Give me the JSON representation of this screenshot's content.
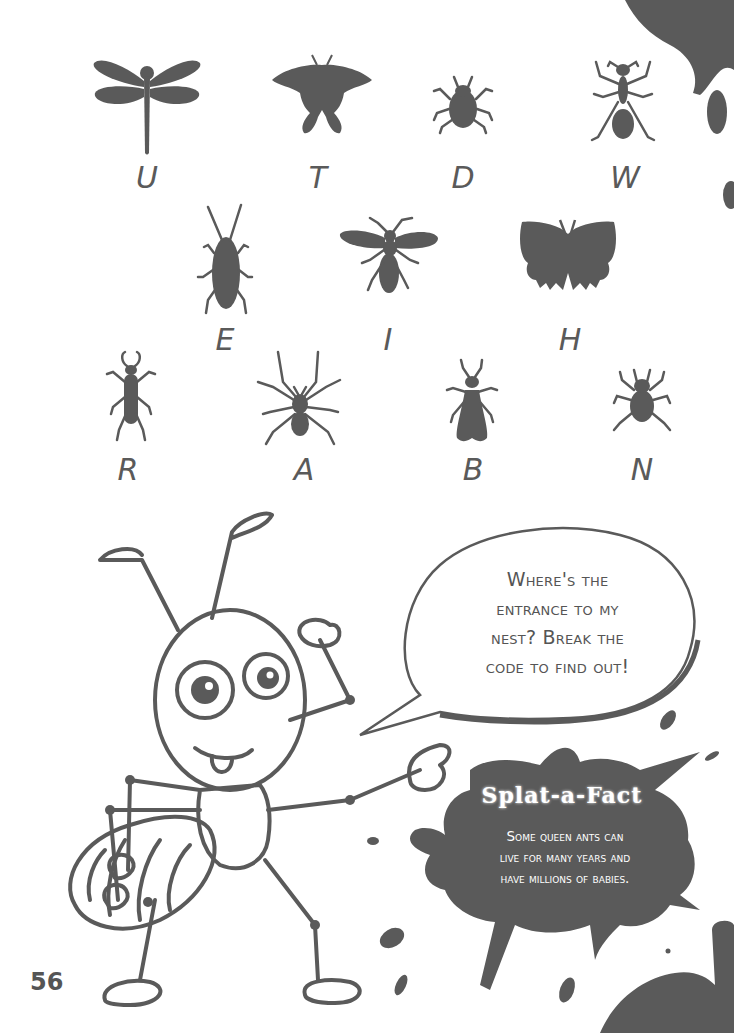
{
  "page": {
    "number": "56",
    "ink_color": "#5a5a5a",
    "background_color": "#ffffff"
  },
  "code_key": {
    "rows": [
      [
        {
          "insect": "dragonfly",
          "letter": "U"
        },
        {
          "insect": "swallowtail-butterfly",
          "letter": "T"
        },
        {
          "insect": "shield-bug",
          "letter": "D"
        },
        {
          "insect": "ant",
          "letter": "W"
        }
      ],
      [
        {
          "insect": "cockroach",
          "letter": "E"
        },
        {
          "insect": "wasp",
          "letter": "I"
        },
        {
          "insect": "butterfly",
          "letter": "H"
        }
      ],
      [
        {
          "insect": "stag-beetle",
          "letter": "R"
        },
        {
          "insect": "spider",
          "letter": "A"
        },
        {
          "insect": "termite",
          "letter": "B"
        },
        {
          "insect": "tick",
          "letter": "N"
        }
      ]
    ]
  },
  "speech_bubble": {
    "lines": [
      "Where's the",
      "entrance to my",
      "nest? Break the",
      "code to find out!"
    ]
  },
  "fact_box": {
    "title": "Splat-a-Fact",
    "lines": [
      "Some queen ants can",
      "live for many years and",
      "have millions of babies."
    ]
  }
}
